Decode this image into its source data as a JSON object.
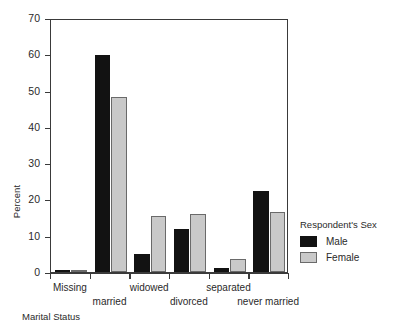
{
  "chart_data": {
    "type": "bar",
    "title": "",
    "xlabel": "Marital Status",
    "ylabel": "Percent",
    "ylim": [
      0,
      70
    ],
    "yticks": [
      0,
      10,
      20,
      30,
      40,
      50,
      60,
      70
    ],
    "grid": false,
    "legend_position": "right",
    "legend_title": "Respondent's Sex",
    "categories": [
      "Missing",
      "married",
      "widowed",
      "divorced",
      "separated",
      "never married"
    ],
    "series": [
      {
        "name": "Male",
        "color": "#121212",
        "values": [
          0.3,
          59.8,
          5.0,
          11.8,
          1.0,
          22.2
        ]
      },
      {
        "name": "Female",
        "color": "#c9c9c9",
        "values": [
          0.3,
          48.2,
          15.3,
          16.0,
          3.6,
          16.6
        ]
      }
    ]
  },
  "axes": {
    "y_title": "Percent",
    "x_title": "Marital Status",
    "y_tick_labels": [
      "0",
      "10",
      "20",
      "30",
      "40",
      "50",
      "60",
      "70"
    ],
    "x_tick_labels": [
      "Missing",
      "married",
      "widowed",
      "divorced",
      "separated",
      "never married"
    ]
  },
  "legend": {
    "title": "Respondent's Sex",
    "entries": [
      {
        "label": "Male",
        "swatch": "black-square"
      },
      {
        "label": "Female",
        "swatch": "gray-square"
      }
    ]
  }
}
